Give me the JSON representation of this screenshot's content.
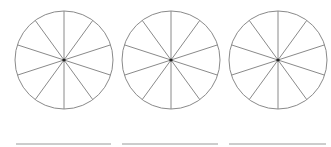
{
  "diagram": {
    "stroke_color": "#8a8a8a",
    "center_dot_color": "#222222",
    "line_color": "#9a9a9a",
    "circles": [
      {
        "cx": 64,
        "cy": 60,
        "r": 49,
        "sectors": 10,
        "shaded": 0
      },
      {
        "cx": 171,
        "cy": 60,
        "r": 49,
        "sectors": 10,
        "shaded": 0
      },
      {
        "cx": 278,
        "cy": 60,
        "r": 49,
        "sectors": 10,
        "shaded": 0
      }
    ],
    "answer_lines": [
      {
        "x1": 16,
        "x2": 111,
        "y": 144
      },
      {
        "x1": 122,
        "x2": 218,
        "y": 144
      },
      {
        "x1": 229,
        "x2": 326,
        "y": 144
      }
    ]
  }
}
